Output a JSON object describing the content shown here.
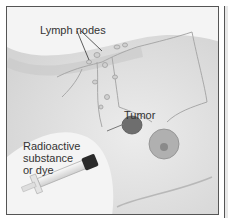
{
  "figure": {
    "labels": {
      "lymph_nodes": "Lymph nodes",
      "tumor": "Tumor",
      "injection_line1": "Radioactive",
      "injection_line2": "substance",
      "injection_line3": "or dye"
    },
    "colors": {
      "skin": "#dcdcdc",
      "background": "#f4f4f4",
      "tumor": "#6e6e6e",
      "areola": "#9a9a9a",
      "frame": "#555555",
      "syringe_cap": "#2a2a2a"
    }
  }
}
